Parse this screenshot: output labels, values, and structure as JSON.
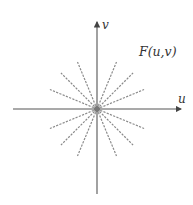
{
  "diagram": {
    "title_label": "F(u,v)",
    "x_axis_label": "u",
    "y_axis_label": "v",
    "origin": {
      "x": 97,
      "y": 109
    },
    "ray_count": 16,
    "ray_angles_deg": [
      0,
      22.5,
      45,
      67.5,
      90,
      112.5,
      135,
      157.5,
      180,
      202.5,
      225,
      247.5,
      270,
      292.5,
      315,
      337.5
    ],
    "ray_length": 51,
    "colors": {
      "axis": "#555555",
      "ray": "#8a8a8a",
      "origin_dot": "#777777",
      "text": "#333333"
    }
  }
}
